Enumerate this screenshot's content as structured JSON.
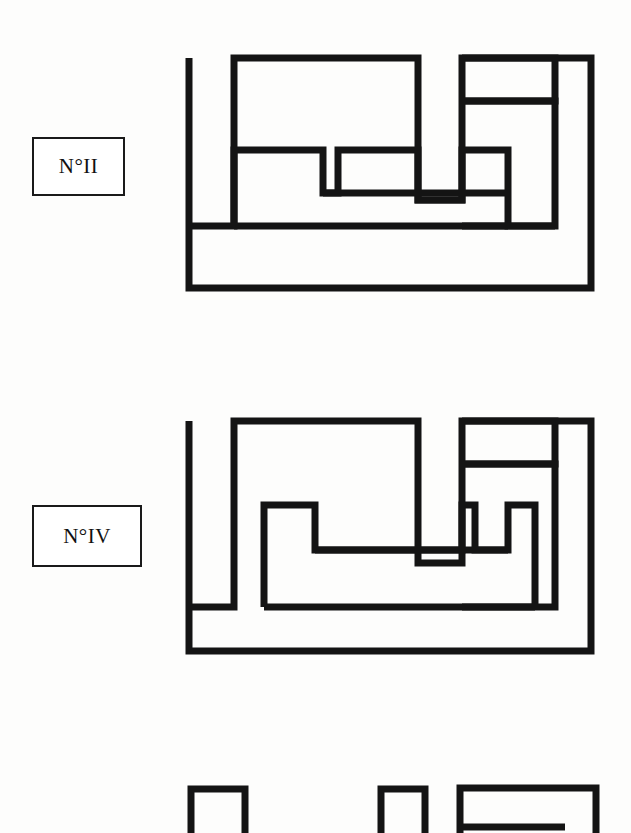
{
  "page": {
    "background_color": "#fdfdfc",
    "ink_color": "#141414",
    "width": 631,
    "height": 833
  },
  "figures": [
    {
      "id": "figure-2",
      "label": "N°II",
      "label_box": {
        "x": 32,
        "y": 137,
        "width": 93,
        "height": 59
      },
      "shapes": [
        {
          "name": "outer-u-frame",
          "points": "11,15 11,245 403,245 403,12 280,12 280,15 369,15 369,210 52,210 52,15 48,15 48,12 11,12"
        },
        {
          "name": "outer-u-frame-outline",
          "points": "11,12 11,248 406,248 406,12 282,12 282,18 372,18 372,213 49,213 49,18 48,18 48,12"
        }
      ]
    },
    {
      "id": "figure-4",
      "label": "N°IV",
      "label_box": {
        "x": 32,
        "y": 505,
        "width": 110,
        "height": 62
      }
    },
    {
      "id": "figure-6",
      "label": "",
      "note": "third plate cropped by the page edge; only the tops of three pieces are visible"
    }
  ],
  "labels": {
    "figure_2": "N°II",
    "figure_4": "N°IV"
  },
  "cropped_pieces": {
    "count": 3,
    "note": "tops of three rectilinear pieces visible along the bottom edge"
  }
}
